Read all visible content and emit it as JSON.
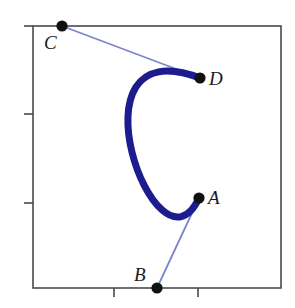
{
  "figure": {
    "type": "bezier-curve-diagram",
    "width": 295,
    "height": 308,
    "background": "#ffffff",
    "colors": {
      "curve": "#1c1c8f",
      "control_line": "#7b85d0",
      "point": "#111111",
      "frame": "#4a4a4a"
    },
    "frame": {
      "left": 33,
      "top": 26,
      "right": 281,
      "bottom": 288,
      "stroke_width": 1.6,
      "ticks": {
        "left": [
          114,
          203
        ],
        "bottom": [
          114,
          198
        ],
        "length": 9
      }
    }
  },
  "labels": {
    "A": "A",
    "B": "B",
    "C": "C",
    "D": "D"
  },
  "chart_data": {
    "type": "scatter",
    "title": "",
    "xlabel": "",
    "ylabel": "",
    "points": [
      {
        "name": "A",
        "x": 199,
        "y": 198,
        "role": "curve-endpoint"
      },
      {
        "name": "B",
        "x": 157,
        "y": 288,
        "role": "control-point"
      },
      {
        "name": "C",
        "x": 62,
        "y": 26,
        "role": "control-point"
      },
      {
        "name": "D",
        "x": 200,
        "y": 78,
        "role": "curve-endpoint"
      }
    ],
    "control_lines": [
      {
        "from": "C",
        "to": "D",
        "color": "#7b85d0",
        "width": 1.8
      },
      {
        "from": "B",
        "to": "A",
        "color": "#7b85d0",
        "width": 1.8
      }
    ],
    "curve": {
      "kind": "cubic-bezier",
      "p0": [
        199,
        198
      ],
      "p1": [
        157,
        288
      ],
      "p2": [
        62,
        26
      ],
      "p3": [
        200,
        78
      ],
      "color": "#1c1c8f",
      "width": 7
    },
    "legend": [],
    "grid": false
  }
}
